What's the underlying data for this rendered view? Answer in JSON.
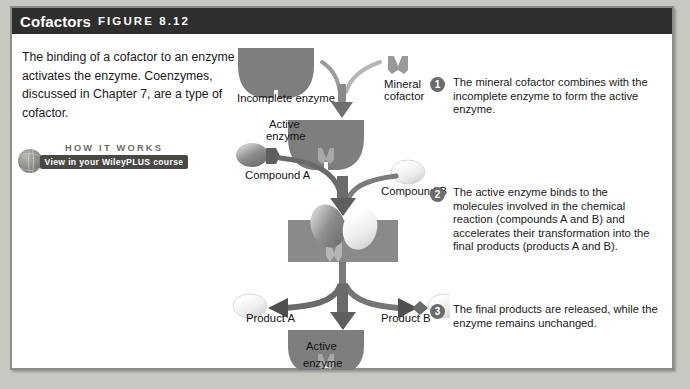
{
  "header": {
    "title": "Cofactors",
    "figure_label": "FIGURE 8.12"
  },
  "intro": {
    "text": "The binding of a cofactor to an enzyme activates the enzyme. Coenzymes, discussed in Chapter 7, are a type of cofactor."
  },
  "how_it_works": {
    "heading": "HOW IT WORKS",
    "button_label": "View in your WileyPLUS course"
  },
  "diagram": {
    "labels": {
      "incomplete_enzyme": "Incomplete enzyme",
      "mineral_cofactor_line1": "Mineral",
      "mineral_cofactor_line2": "cofactor",
      "active_enzyme_top_line1": "Active",
      "active_enzyme_top_line2": "enzyme",
      "compound_a": "Compound A",
      "compound_b": "Compound B",
      "product_a": "Product A",
      "product_b": "Product B",
      "active_enzyme_bottom_line1": "Active",
      "active_enzyme_bottom_line2": "enzyme"
    },
    "colors": {
      "enzyme_fill": "#7e7e7e",
      "cofactor_fill": "#9a9a9a",
      "compound_a_fill": "#8f8f8f",
      "compound_b_fill": "#ececec",
      "arrow_fill": "#5a5a5a",
      "header_bg": "#2e2e2e"
    }
  },
  "steps": [
    {
      "number": "1",
      "text": "The mineral cofactor combines with the incomplete enzyme to form the active enzyme."
    },
    {
      "number": "2",
      "text": "The active enzyme binds to the molecules involved in the chemical reaction (compounds A and B) and accelerates their transformation into the final products (products A and B)."
    },
    {
      "number": "3",
      "text": "The final products are released, while the enzyme remains unchanged."
    }
  ]
}
